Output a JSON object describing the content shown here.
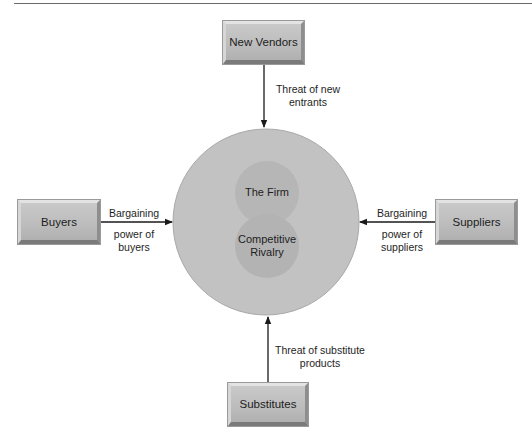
{
  "diagram": {
    "center": {
      "outer_circle_color": "#c2c2c2",
      "inner_circle_color": "#b4b4b4",
      "firm_label": "The Firm",
      "rivalry_label_line1": "Competitive",
      "rivalry_label_line2": "Rivalry"
    },
    "forces": [
      {
        "id": "new-vendors",
        "box_label": "New Vendors",
        "arrow_label_line1": "Threat of new",
        "arrow_label_line2": "entrants"
      },
      {
        "id": "buyers",
        "box_label": "Buyers",
        "arrow_label_line1": "Bargaining",
        "arrow_label_line2": "power of",
        "arrow_label_line3": "buyers"
      },
      {
        "id": "suppliers",
        "box_label": "Suppliers",
        "arrow_label_line1": "Bargaining",
        "arrow_label_line2": "power of",
        "arrow_label_line3": "suppliers"
      },
      {
        "id": "substitutes",
        "box_label": "Substitutes",
        "arrow_label_line1": "Threat of substitute",
        "arrow_label_line2": "products"
      }
    ],
    "colors": {
      "box_face": "#bdbdbd",
      "line": "#1a1a1a",
      "rule": "#6a6a6a"
    }
  }
}
